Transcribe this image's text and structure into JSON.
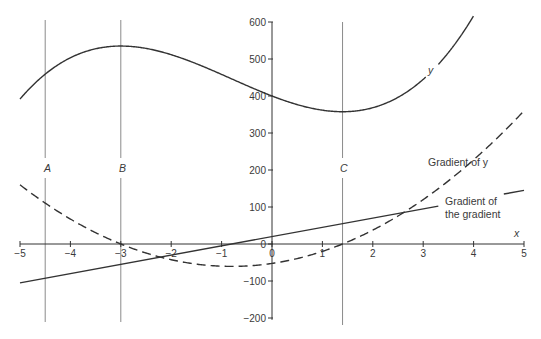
{
  "chart_data": {
    "type": "line",
    "title": "",
    "xlabel": "x",
    "ylabel": "",
    "xlim": [
      -5,
      5
    ],
    "ylim": [
      -200,
      600
    ],
    "grid": false,
    "legend": "none (curves labelled directly)",
    "x_ticks": [
      -5,
      -4,
      -3,
      -2,
      -1,
      0,
      1,
      2,
      3,
      4,
      5
    ],
    "y_ticks": [
      -200,
      -100,
      0,
      100,
      200,
      300,
      400,
      500,
      600
    ],
    "x_tick_labels": [
      "−5",
      "−4",
      "−3",
      "−2",
      "−1",
      "0",
      "1",
      "2",
      "3",
      "4",
      "5"
    ],
    "y_tick_labels": [
      "−200",
      "−100",
      "0",
      "100",
      "200",
      "300",
      "400",
      "500",
      "600"
    ],
    "x": [
      -5,
      -4.5,
      -4,
      -3.5,
      -3,
      -2.5,
      -2,
      -1.5,
      -1,
      -0.5,
      0,
      0.5,
      1,
      1.4,
      1.5,
      2,
      2.5,
      3,
      3.5,
      4,
      4.5,
      5
    ],
    "series": [
      {
        "name": "y",
        "style": "solid",
        "values": [
          391.7,
          453.1,
          493.3,
          518.4,
          535.0,
          529.0,
          516.7,
          494.4,
          465.4,
          433.2,
          400.0,
          373.4,
          357.1,
          357.6,
          357.9,
          370.0,
          410.0,
          452.5,
          522.7,
          616.7,
          null,
          null
        ],
        "label": "y",
        "note": "clipped at top of plot (600) near x≈4"
      },
      {
        "name": "Gradient of y",
        "style": "dashed",
        "values": [
          160.0,
          112.5,
          67.5,
          27.5,
          0.0,
          -16.3,
          -42.5,
          -61.9,
          -60.0,
          -55.6,
          -52.5,
          -42.2,
          -5.0,
          0.0,
          1.9,
          37.5,
          83.1,
          116.3,
          155.6,
          195.0,
          261.3,
          360.0
        ],
        "label": "Gradient of y"
      },
      {
        "name": "Gradient of the gradient",
        "style": "solid",
        "values": [
          -105.0,
          -92.5,
          -80.0,
          -67.5,
          -55.0,
          -42.5,
          -30.0,
          -17.5,
          -5.0,
          7.5,
          20.0,
          32.5,
          45.0,
          55.0,
          57.5,
          70.0,
          82.5,
          95.0,
          107.5,
          120.0,
          132.5,
          145.0
        ],
        "label": "Gradient of the gradient"
      }
    ],
    "vertical_lines": [
      {
        "label": "A",
        "x": -4.5
      },
      {
        "label": "B",
        "x": -3
      },
      {
        "label": "C",
        "x": 1.4
      }
    ],
    "annotations": [
      {
        "text": "y",
        "position": "on solid cubic curve near x≈3.2"
      },
      {
        "text": "Gradient of y",
        "position": "beside dashed curve near x≈3.5, y≈210"
      },
      {
        "text": "Gradient of",
        "line2": "the gradient",
        "position": "beside straight line near x≈3.5–4.8, y≈100"
      },
      {
        "text": "x",
        "position": "axis label at right end of x-axis"
      }
    ]
  },
  "labels": {
    "x_axis": "x",
    "curve_y": "y",
    "grad_y": "Gradient of y",
    "grad_grad_1": "Gradient of",
    "grad_grad_2": "the gradient",
    "line_A": "A",
    "line_B": "B",
    "line_C": "C"
  },
  "colors": {
    "curve": "#333333",
    "axis": "#333333",
    "guide": "#8a8a8a",
    "text": "#3a3a3a"
  }
}
